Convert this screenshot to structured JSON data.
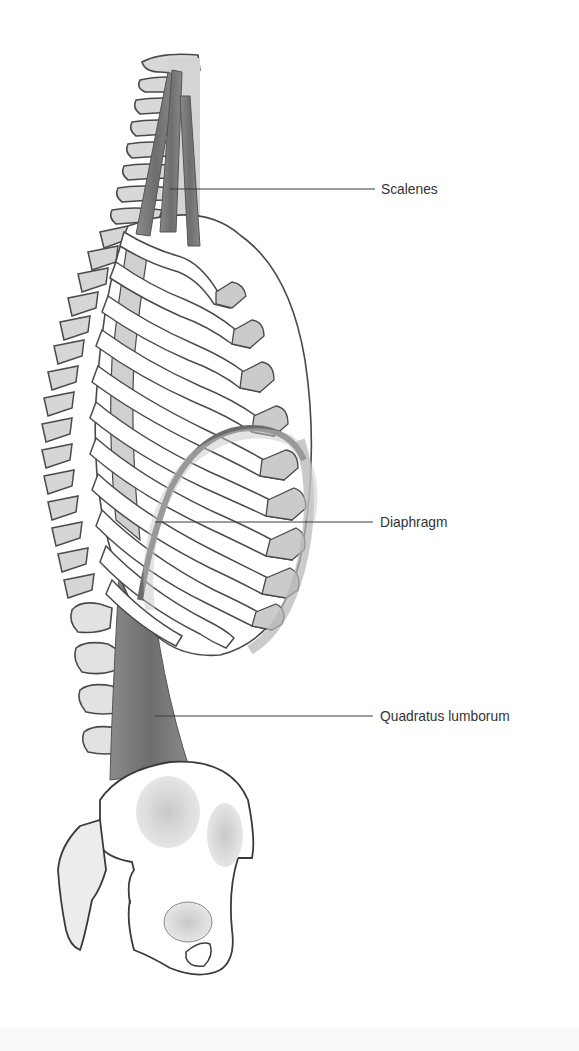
{
  "figure": {
    "colors": {
      "background": "#ffffff",
      "outline": "#4a4a4a",
      "bone_fill": "#ffffff",
      "bone_shade": "#cfcfcf",
      "cartilage": "#c8c8c8",
      "muscle": "#7a7a7a",
      "diaphragm": "#6b6b6b",
      "label_text": "#333333",
      "leader_line": "#3a3a3a"
    }
  },
  "labels": [
    {
      "id": "scalenes",
      "text": "Scalenes",
      "x": 381,
      "y": 180,
      "line": {
        "x1": 170,
        "y1": 189,
        "x2": 375,
        "y2": 189
      }
    },
    {
      "id": "diaphragm",
      "text": "Diaphragm",
      "x": 380,
      "y": 513,
      "line": {
        "x1": 155,
        "y1": 522,
        "x2": 373,
        "y2": 522
      }
    },
    {
      "id": "quadratus-lumborum",
      "text": "Quadratus lumborum",
      "x": 380,
      "y": 707,
      "line": {
        "x1": 155,
        "y1": 716,
        "x2": 373,
        "y2": 716
      }
    }
  ]
}
